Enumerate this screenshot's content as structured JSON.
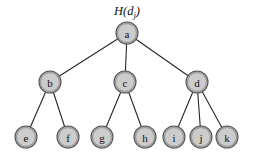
{
  "diagram": {
    "type": "tree",
    "title_caption": {
      "full_text": "H(dj)",
      "func": "H",
      "open_paren": "(",
      "variable": "d",
      "subscript": "j",
      "close_paren": ")",
      "x": 127,
      "y": 15
    },
    "canvas": {
      "width": 257,
      "height": 153,
      "background": "#ffffff"
    },
    "style": {
      "node_fill": "#cccccc",
      "node_ring": "#b3b3b3",
      "node_stroke": "#8f8f8f",
      "edge_color": "#262626",
      "label_color": "#111111",
      "node_radius": 11
    },
    "nodes": [
      {
        "id": "a",
        "label": "a",
        "x": 127,
        "y": 33,
        "level": 0
      },
      {
        "id": "b",
        "label": "b",
        "x": 50,
        "y": 82,
        "level": 1
      },
      {
        "id": "c",
        "label": "c",
        "x": 125,
        "y": 82,
        "level": 1
      },
      {
        "id": "d",
        "label": "d",
        "x": 197,
        "y": 82,
        "level": 1
      },
      {
        "id": "e",
        "label": "e",
        "x": 26,
        "y": 137,
        "level": 2
      },
      {
        "id": "f",
        "label": "f",
        "x": 68,
        "y": 137,
        "level": 2
      },
      {
        "id": "g",
        "label": "g",
        "x": 102,
        "y": 137,
        "level": 2
      },
      {
        "id": "h",
        "label": "h",
        "x": 145,
        "y": 137,
        "level": 2
      },
      {
        "id": "i",
        "label": "i",
        "x": 174,
        "y": 137,
        "level": 2
      },
      {
        "id": "j",
        "label": "j",
        "x": 201,
        "y": 137,
        "level": 2
      },
      {
        "id": "k",
        "label": "k",
        "x": 227,
        "y": 137,
        "level": 2
      }
    ],
    "edges": [
      {
        "from": "a",
        "to": "b"
      },
      {
        "from": "a",
        "to": "c"
      },
      {
        "from": "a",
        "to": "d"
      },
      {
        "from": "b",
        "to": "e"
      },
      {
        "from": "b",
        "to": "f"
      },
      {
        "from": "c",
        "to": "g"
      },
      {
        "from": "c",
        "to": "h"
      },
      {
        "from": "d",
        "to": "i"
      },
      {
        "from": "d",
        "to": "j"
      },
      {
        "from": "d",
        "to": "k"
      }
    ]
  }
}
